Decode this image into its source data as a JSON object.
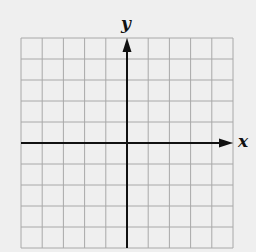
{
  "diagram": {
    "type": "coordinate-plane",
    "x_axis_label": "x",
    "y_axis_label": "y",
    "grid": {
      "columns": 10,
      "rows": 10,
      "left": 21,
      "top": 38,
      "right": 233,
      "bottom": 248
    },
    "origin_grid_col": 5,
    "origin_grid_row": 5,
    "colors": {
      "background": "#efefef",
      "grid": "#a8a8a8",
      "axis": "#111111"
    }
  }
}
